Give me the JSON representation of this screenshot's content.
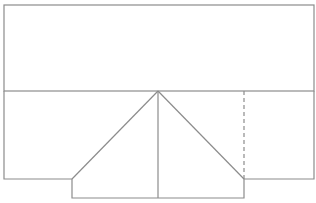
{
  "canvas": {
    "width": 316,
    "height": 203,
    "background": "#ffffff"
  },
  "style": {
    "stroke": "#8c8c8c",
    "stroke_width": 1.2,
    "dash": "4,3"
  },
  "diagram": {
    "top_rect": {
      "x": 4,
      "y": 5,
      "width": 310,
      "height": 86
    },
    "lower_outline": [
      [
        4,
        91
      ],
      [
        4,
        179
      ],
      [
        72,
        179
      ],
      [
        72,
        198
      ],
      [
        244,
        198
      ],
      [
        244,
        179
      ],
      [
        314,
        179
      ],
      [
        314,
        91
      ]
    ],
    "apex": [
      158,
      91
    ],
    "fold_lines": [
      {
        "from": [
          158,
          91
        ],
        "to": [
          72,
          179
        ]
      },
      {
        "from": [
          158,
          91
        ],
        "to": [
          244,
          179
        ]
      },
      {
        "from": [
          158,
          91
        ],
        "to": [
          158,
          198
        ]
      }
    ],
    "dashed_line": {
      "from": [
        244,
        91
      ],
      "to": [
        244,
        179
      ]
    }
  }
}
